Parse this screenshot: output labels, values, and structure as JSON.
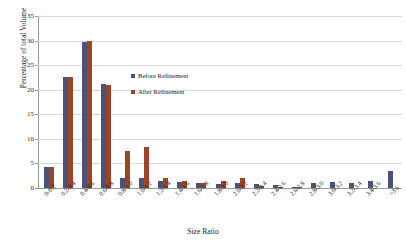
{
  "chart_data": {
    "type": "bar",
    "title": "",
    "xlabel": "Size Ratio",
    "ylabel": "Percentage of total Volume",
    "ylim": [
      0,
      35
    ],
    "ytick_step": 5,
    "yticks": [
      0,
      5,
      10,
      15,
      20,
      25,
      30,
      35
    ],
    "grid": true,
    "legend_position": "inside-upper-center",
    "categories": [
      "0-0.2",
      "0.2-0.4",
      "0.4-0.6",
      "0.6-0.8",
      "0.8-1.0",
      "1.0-1.2",
      "1.2-1.4",
      "1.4-1.6",
      "1.6-1.8",
      "1.8-2.0",
      "2.0-2.2",
      "2.2-2.4",
      "2.4-2.6",
      "2.6-2.8",
      "2.8-3.0",
      "3.0-3.2",
      "3.2-3.4",
      "3.4-3.6",
      ">3.6"
    ],
    "series": [
      {
        "name": "Before Refinement",
        "color": "#47537a",
        "values": [
          4.3,
          22.5,
          29.8,
          21.1,
          2.1,
          2.0,
          1.5,
          1.3,
          1.0,
          0.9,
          1.0,
          0.8,
          0.7,
          0.3,
          1.1,
          1.2,
          1.1,
          1.4,
          3.5
        ]
      },
      {
        "name": "After Refinement",
        "color": "#9c4425",
        "values": [
          4.3,
          22.6,
          30.0,
          21.0,
          7.5,
          8.3,
          2.1,
          1.4,
          1.1,
          1.5,
          2.0,
          0.5,
          0.3,
          0.2,
          0.0,
          0.0,
          0.0,
          0.0,
          0.0
        ]
      }
    ]
  },
  "legend": {
    "items": [
      {
        "label": "Before Refinement"
      },
      {
        "label": "After Refinement"
      }
    ]
  }
}
